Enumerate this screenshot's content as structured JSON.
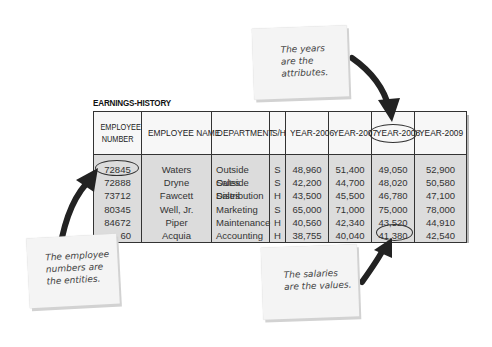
{
  "table": {
    "title": "EARNINGS-HISTORY",
    "columns": [
      "EMPLOYEE NUMBER",
      "EMPLOYEE NAME",
      "DEPARTMENT",
      "S/H",
      "YEAR-2006",
      "YEAR-2007",
      "YEAR-2008",
      "YEAR-2009"
    ],
    "header_lines": {
      "number_line1": "EMPLOYEE",
      "number_line2": "NUMBER"
    },
    "rows": [
      {
        "number": "72845",
        "name": "Waters",
        "department": "Outside Sales",
        "sh": "S",
        "y2006": "48,960",
        "y2007": "51,400",
        "y2008": "49,050",
        "y2009": "52,900"
      },
      {
        "number": "72888",
        "name": "Dryne",
        "department": "Outside Sales",
        "sh": "S",
        "y2006": "42,200",
        "y2007": "44,700",
        "y2008": "48,020",
        "y2009": "50,580"
      },
      {
        "number": "73712",
        "name": "Fawcett",
        "department": "Distribution",
        "sh": "H",
        "y2006": "43,500",
        "y2007": "45,500",
        "y2008": "46,780",
        "y2009": "47,100"
      },
      {
        "number": "80345",
        "name": "Well, Jr.",
        "department": "Marketing",
        "sh": "S",
        "y2006": "65,000",
        "y2007": "71,000",
        "y2008": "75,000",
        "y2009": "78,000"
      },
      {
        "number": "84672",
        "name": "Piper",
        "department": "Maintenance",
        "sh": "H",
        "y2006": "40,560",
        "y2007": "42,340",
        "y2008": "43,520",
        "y2009": "44,910"
      },
      {
        "number": "60",
        "name": "Acquia",
        "department": "Accounting",
        "sh": "H",
        "y2006": "38,755",
        "y2007": "40,040",
        "y2008": "41,380",
        "y2009": "42,540"
      }
    ],
    "highlights": {
      "entity": "72888",
      "attribute": "YEAR-2008",
      "value": "41,380"
    }
  },
  "notes": {
    "attributes": {
      "line1": "The years",
      "line2": "are the",
      "line3": "attributes."
    },
    "entities": {
      "line1": "The employee",
      "line2": "numbers are",
      "line3": "the entities."
    },
    "values": {
      "line1": "The salaries",
      "line2": "are the values."
    }
  },
  "colors": {
    "table_body": "#dcdcdc",
    "table_header": "#f7f7f7",
    "arrow": "#222222",
    "note": "#f4f4f4"
  }
}
